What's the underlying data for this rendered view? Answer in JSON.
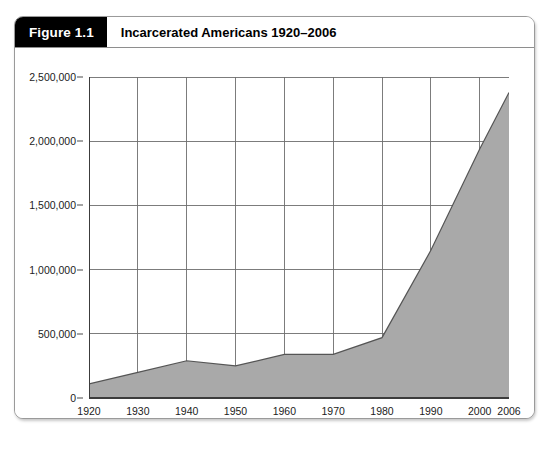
{
  "figure": {
    "tag": "Figure 1.1",
    "title": "Incarcerated Americans 1920–2006"
  },
  "colors": {
    "tag_background": "#000000",
    "tag_text": "#ffffff",
    "area_fill": "#a9a9a9",
    "area_stroke": "#555555",
    "gridline": "#6e6e6e",
    "axis": "#3c3c3c",
    "card_border": "#9a9a9a",
    "page_background": "#ffffff"
  },
  "chart_data": {
    "type": "area",
    "title": "Incarcerated Americans 1920–2006",
    "xlabel": "",
    "ylabel": "",
    "x": [
      1920,
      1930,
      1940,
      1950,
      1960,
      1970,
      1980,
      1990,
      2000,
      2006
    ],
    "values": [
      110000,
      200000,
      290000,
      250000,
      340000,
      340000,
      470000,
      1150000,
      1940000,
      2380000
    ],
    "xlim": [
      1920,
      2006
    ],
    "ylim": [
      0,
      2500000
    ],
    "xticks": [
      1920,
      1930,
      1940,
      1950,
      1960,
      1970,
      1980,
      1990,
      2000,
      2006
    ],
    "xtick_labels": [
      "1920",
      "1930",
      "1940",
      "1950",
      "1960",
      "1970",
      "1980",
      "1990",
      "2000",
      "2006"
    ],
    "yticks": [
      0,
      500000,
      1000000,
      1500000,
      2000000,
      2500000
    ],
    "ytick_labels": [
      "0",
      "500,000",
      "1,000,000",
      "1,500,000",
      "2,000,000",
      "2,500,000"
    ],
    "grid": true,
    "grid_axis": "both",
    "legend": null,
    "legend_position": "none",
    "series": [
      {
        "name": "Incarcerated Americans",
        "values": [
          110000,
          200000,
          290000,
          250000,
          340000,
          340000,
          470000,
          1150000,
          1940000,
          2380000
        ]
      }
    ]
  }
}
